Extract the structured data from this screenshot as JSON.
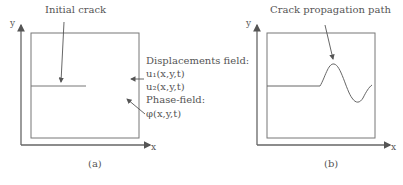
{
  "panel_a": {
    "caption": "(a)",
    "axis_x": "x",
    "axis_y": "y",
    "label_crack": "Initial crack",
    "label_disp": "Displacements field:",
    "label_u1": "u₁(x,y,t)",
    "label_u2": "u₂(x,y,t)",
    "label_phase": "Phase-field:",
    "label_phi": "φ(x,y,t)"
  },
  "panel_b": {
    "caption": "(b)",
    "axis_x": "x",
    "axis_y": "y",
    "label_path": "Crack propagation path"
  }
}
